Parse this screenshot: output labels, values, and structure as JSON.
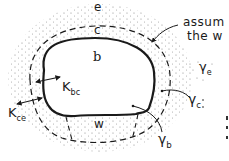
{
  "diagram": {
    "regions": {
      "e": "e",
      "c": "c",
      "b": "b",
      "w": "w"
    },
    "labels": {
      "k_bc": "K",
      "k_bc_sub": "bc",
      "k_ce": "K",
      "k_ce_sub": "ce",
      "gamma_e": "γ",
      "gamma_e_sub": "e",
      "gamma_c": "γ",
      "gamma_c_sub": "c",
      "gamma_b": "γ",
      "gamma_b_sub": "b"
    },
    "annotation": {
      "line1": "assum",
      "line2": "the w"
    },
    "colors": {
      "ink": "#1a1a1a",
      "stipple": "#8a8a8a",
      "background": "#ffffff"
    }
  }
}
